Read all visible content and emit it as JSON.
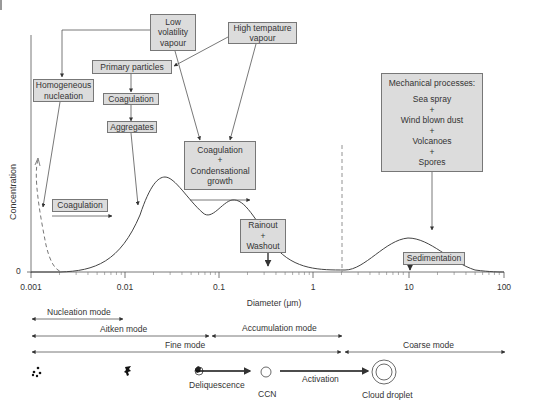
{
  "chart_data": {
    "type": "line",
    "title": "",
    "xlabel": "Diameter (μm)",
    "ylabel": "Concentration",
    "xscale": "log",
    "xlim": [
      0.001,
      100
    ],
    "x_ticks": [
      "0.001",
      "0.01",
      "0.1",
      "1",
      "10",
      "100"
    ],
    "y_ticks": [
      "0"
    ],
    "series": [
      {
        "name": "Nucleation mode (dashed)",
        "style": "dashed",
        "peak_x": 0.0011,
        "relative_height": 0.5
      },
      {
        "name": "Aitken mode",
        "peak_x": 0.02,
        "relative_height": 0.78
      },
      {
        "name": "Accumulation mode",
        "peak_x": 0.2,
        "relative_height": 0.55
      },
      {
        "name": "Coarse mode",
        "peak_x": 10,
        "relative_height": 0.25
      }
    ],
    "annotations": [
      "dashed vertical line at ~2 μm"
    ]
  },
  "boxes": {
    "low_volatility": "Low\nvolatility\nvapour",
    "low_volatility_lines": [
      "Low",
      "volatility",
      "vapour"
    ],
    "high_temp": [
      "High tempature",
      "vapour"
    ],
    "primary": "Primary particles",
    "homogeneous": [
      "Homogeneous",
      "nucleation"
    ],
    "coag1": "Coagulation",
    "aggregates": "Aggregates",
    "coag_cond": [
      "Coagulation",
      "+",
      "Condensational",
      "growth"
    ],
    "coagulation_left": "Coagulation",
    "rainout": [
      "Rainout",
      "+",
      "Washout"
    ],
    "mechanical": [
      "Mechanical processes:",
      "Sea spray",
      "+",
      "Wind blown dust",
      "+",
      "Volcanoes",
      "+",
      "Spores"
    ],
    "sedimentation": "Sedimentation"
  },
  "modes": {
    "nucleation": "Nucleation mode",
    "aitken": "Aitken mode",
    "accumulation": "Accumulation mode",
    "fine": "Fine mode",
    "coarse": "Coarse mode"
  },
  "process": {
    "deliquescence": "Deliquescence",
    "ccn": "CCN",
    "activation": "Activation",
    "cloud_droplet": "Cloud droplet"
  }
}
